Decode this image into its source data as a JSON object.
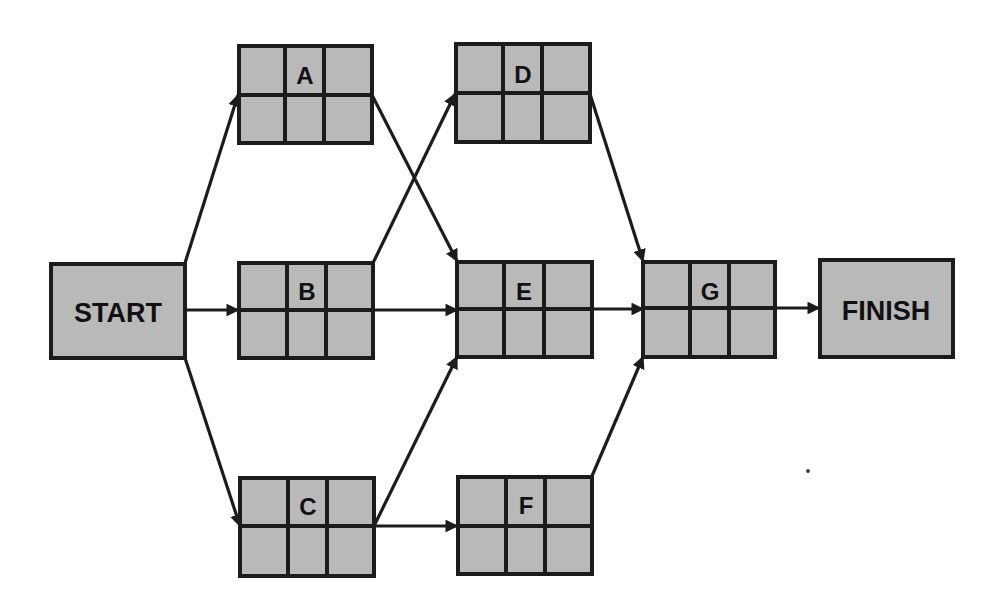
{
  "diagram": {
    "type": "activity-on-node network",
    "colors": {
      "node_fill": "#b9b9b9",
      "stroke": "#1c1c1c",
      "background": "#ffffff"
    },
    "nodes": {
      "start": {
        "label": "START",
        "kind": "terminal"
      },
      "a": {
        "label": "A",
        "kind": "task"
      },
      "b": {
        "label": "B",
        "kind": "task"
      },
      "c": {
        "label": "C",
        "kind": "task"
      },
      "d": {
        "label": "D",
        "kind": "task"
      },
      "e": {
        "label": "E",
        "kind": "task"
      },
      "f": {
        "label": "F",
        "kind": "task"
      },
      "g": {
        "label": "G",
        "kind": "task"
      },
      "finish": {
        "label": "FINISH",
        "kind": "terminal"
      }
    },
    "edges": [
      {
        "from": "START",
        "to": "A"
      },
      {
        "from": "START",
        "to": "B"
      },
      {
        "from": "START",
        "to": "C"
      },
      {
        "from": "A",
        "to": "E"
      },
      {
        "from": "B",
        "to": "D"
      },
      {
        "from": "B",
        "to": "E"
      },
      {
        "from": "C",
        "to": "E"
      },
      {
        "from": "C",
        "to": "F"
      },
      {
        "from": "D",
        "to": "G"
      },
      {
        "from": "E",
        "to": "G"
      },
      {
        "from": "F",
        "to": "G"
      },
      {
        "from": "G",
        "to": "FINISH"
      }
    ]
  }
}
